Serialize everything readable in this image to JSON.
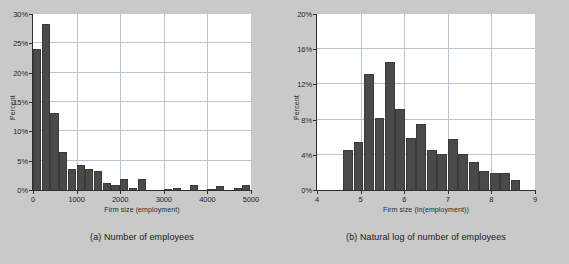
{
  "figure": {
    "background_color": "#c9c9c9",
    "bar_color": "#4a4a4a",
    "grid_color": "#b9c4cf",
    "axis_color": "#2f2f2f",
    "plot_background": "#ffffff"
  },
  "panels": [
    {
      "id": "panel-a",
      "caption": "(a) Number of employees",
      "chart_data": {
        "type": "bar",
        "title": "",
        "subtitle": "",
        "xlabel": "Firm size (employment)",
        "ylabel": "Percent",
        "xlim": [
          0,
          5000
        ],
        "ylim": [
          0,
          30
        ],
        "grid": true,
        "legend": null,
        "xticks": [
          0,
          1000,
          2000,
          3000,
          4000,
          5000
        ],
        "xticklabels": [
          "0",
          "1000",
          "2000",
          "3000",
          "4000",
          "5000"
        ],
        "yticks": [
          0,
          5,
          10,
          15,
          20,
          25,
          30
        ],
        "yticklabels": [
          "0%",
          "5%",
          "10%",
          "15%",
          "20%",
          "25%",
          "30%"
        ],
        "bin_width": 200,
        "bin_starts": [
          0,
          200,
          400,
          600,
          800,
          1000,
          1200,
          1400,
          1600,
          1800,
          2000,
          2200,
          2400,
          2600,
          2800,
          3000,
          3200,
          3400,
          3600,
          3800,
          4000,
          4200,
          4400,
          4600,
          4800
        ],
        "categories": [
          "0-200",
          "200-400",
          "400-600",
          "600-800",
          "800-1000",
          "1000-1200",
          "1200-1400",
          "1400-1600",
          "1600-1800",
          "1800-2000",
          "2000-2200",
          "2200-2400",
          "2400-2600",
          "2600-2800",
          "2800-3000",
          "3000-3200",
          "3200-3400",
          "3400-3600",
          "3600-3800",
          "3800-4000",
          "4000-4200",
          "4200-4400",
          "4400-4600",
          "4600-4800",
          "4800-5000"
        ],
        "values": [
          24.0,
          28.3,
          13.1,
          6.5,
          3.5,
          4.2,
          3.6,
          3.2,
          1.2,
          0.8,
          1.8,
          0.4,
          1.8,
          0.0,
          0.0,
          0.2,
          0.4,
          0.0,
          0.8,
          0.0,
          0.1,
          0.7,
          0.0,
          0.3,
          0.9
        ]
      }
    },
    {
      "id": "panel-b",
      "caption": "(b) Natural log of number of employees",
      "chart_data": {
        "type": "bar",
        "title": "",
        "subtitle": "",
        "xlabel": "Firm size (ln(employment))",
        "ylabel": "Percent",
        "xlim": [
          4,
          9
        ],
        "ylim": [
          0,
          20
        ],
        "grid": true,
        "legend": null,
        "xticks": [
          4,
          5,
          6,
          7,
          8,
          9
        ],
        "xticklabels": [
          "4",
          "5",
          "6",
          "7",
          "8",
          "9"
        ],
        "yticks": [
          0,
          4,
          8,
          12,
          16,
          20
        ],
        "yticklabels": [
          "0%",
          "4%",
          "8%",
          "12%",
          "16%",
          "20%"
        ],
        "bin_width": 0.24,
        "bin_starts": [
          4.6,
          4.84,
          5.08,
          5.32,
          5.56,
          5.8,
          6.04,
          6.28,
          6.52,
          6.76,
          7.0,
          7.24,
          7.48,
          7.72,
          7.96,
          8.2,
          8.44,
          8.68
        ],
        "categories": [
          "4.60-4.84",
          "4.84-5.08",
          "5.08-5.32",
          "5.32-5.56",
          "5.56-5.80",
          "5.80-6.04",
          "6.04-6.28",
          "6.28-6.52",
          "6.52-6.76",
          "6.76-7.00",
          "7.00-7.24",
          "7.24-7.48",
          "7.48-7.72",
          "7.72-7.96",
          "7.96-8.20",
          "8.20-8.44",
          "8.44-8.68",
          "8.68-8.92"
        ],
        "values": [
          4.6,
          5.5,
          13.2,
          8.2,
          14.5,
          9.2,
          5.9,
          7.5,
          4.5,
          4.1,
          5.8,
          4.1,
          3.2,
          2.2,
          1.9,
          1.9,
          1.1,
          0.0
        ]
      }
    }
  ]
}
